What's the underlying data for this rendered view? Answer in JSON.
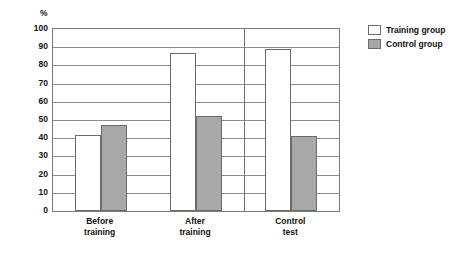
{
  "chart_data": {
    "type": "bar",
    "title": "",
    "subtitle": "",
    "xlabel": "",
    "ylabel": "%",
    "ylim": [
      0,
      100
    ],
    "ytick_step": 10,
    "yticks": [
      100,
      90,
      80,
      70,
      60,
      50,
      40,
      30,
      20,
      10,
      0
    ],
    "grid": true,
    "grid_axis": "y",
    "legend_position": "top-right",
    "categories": [
      "Before training",
      "After training",
      "Control test"
    ],
    "category_lines": [
      [
        "Before",
        "training"
      ],
      [
        "After",
        "training"
      ],
      [
        "Control",
        "test"
      ]
    ],
    "series": [
      {
        "name": "Training group",
        "color": "#ffffff",
        "edge_color": "#6b6b6b",
        "values": [
          42,
          87,
          89
        ]
      },
      {
        "name": "Control group",
        "color": "#a8a8a8",
        "edge_color": "#6b6b6b",
        "values": [
          47,
          52,
          41
        ]
      }
    ],
    "group_divider_after_category": 2,
    "annotations": []
  },
  "legend": {
    "items": [
      {
        "label": "Training group",
        "swatch": "training"
      },
      {
        "label": "Control group",
        "swatch": "control"
      }
    ]
  },
  "axis": {
    "unit_label": "%"
  }
}
